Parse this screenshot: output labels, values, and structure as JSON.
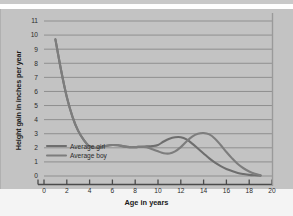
{
  "chart_data": {
    "type": "line",
    "title": "",
    "xlabel": "Age in years",
    "ylabel": "Height gain in inches per year",
    "xlim": [
      0,
      20
    ],
    "ylim": [
      0,
      11
    ],
    "grid": true,
    "grid_axis": "y",
    "legend_position": "inside-lower-left",
    "xticks": [
      "0",
      "2",
      "4",
      "6",
      "8",
      "10",
      "12",
      "14",
      "16",
      "18",
      "20"
    ],
    "xtick_values": [
      0,
      2,
      4,
      6,
      8,
      10,
      12,
      14,
      16,
      18,
      20
    ],
    "yticks": [
      "0",
      "1",
      "2",
      "3",
      "4",
      "5",
      "6",
      "7",
      "8",
      "9",
      "10",
      "11"
    ],
    "ytick_values": [
      0,
      1,
      2,
      3,
      4,
      5,
      6,
      7,
      8,
      9,
      10,
      11
    ],
    "x": [
      1,
      1.5,
      2,
      2.5,
      3,
      3.5,
      4,
      4.5,
      5,
      5.5,
      6,
      6.5,
      7,
      7.5,
      8,
      8.5,
      9,
      9.5,
      10,
      10.5,
      11,
      11.5,
      12,
      12.5,
      13,
      13.5,
      14,
      14.5,
      15,
      15.5,
      16,
      16.5,
      17,
      17.5,
      18,
      18.5,
      19
    ],
    "series": [
      {
        "name": "Average girl",
        "color": "#6e6e6e",
        "values": [
          9.7,
          7.5,
          5.6,
          4.2,
          3.2,
          2.55,
          2.1,
          2.0,
          2.05,
          2.15,
          2.2,
          2.18,
          2.1,
          2.05,
          2.05,
          2.08,
          2.1,
          2.12,
          2.2,
          2.45,
          2.65,
          2.75,
          2.75,
          2.6,
          2.3,
          1.95,
          1.6,
          1.25,
          0.95,
          0.7,
          0.5,
          0.35,
          0.22,
          0.14,
          0.08,
          0.05,
          0.03
        ]
      },
      {
        "name": "Average boy",
        "color": "#7d7d7d",
        "values": [
          9.7,
          7.5,
          5.6,
          4.2,
          3.2,
          2.55,
          2.1,
          2.0,
          2.05,
          2.15,
          2.2,
          2.18,
          2.1,
          2.05,
          2.05,
          2.08,
          2.05,
          1.9,
          1.75,
          1.62,
          1.6,
          1.75,
          2.05,
          2.45,
          2.8,
          3.0,
          3.05,
          2.95,
          2.65,
          2.2,
          1.7,
          1.25,
          0.85,
          0.55,
          0.32,
          0.16,
          0.06
        ]
      }
    ],
    "annotations": {
      "girl_peak": {
        "age": 12,
        "value": 2.75
      },
      "boy_peak": {
        "age": 14,
        "value": 3.05
      },
      "boy_dip": {
        "age": 11,
        "value": 1.6
      },
      "start_point": {
        "age": 1,
        "value": 9.7
      }
    }
  },
  "legend": {
    "items": [
      {
        "label": "Average girl"
      },
      {
        "label": "Average boy"
      }
    ]
  },
  "colors": {
    "figure_background": "#c3c3c3",
    "grid_line": "#8f8f8f",
    "axis_line": "#4a4a4a",
    "curve": "#6e6e6e",
    "text": "#1a1a1a"
  }
}
